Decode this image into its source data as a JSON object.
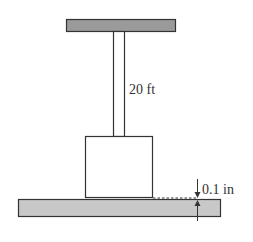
{
  "diagram": {
    "type": "physics-figure",
    "labels": {
      "rod_length": "20 ft",
      "gap": "0.1 in"
    },
    "colors": {
      "plate_fill": "#9a9a9a",
      "floor_fill": "#c8c8c8",
      "stroke": "#333333",
      "background": "#ffffff"
    }
  }
}
